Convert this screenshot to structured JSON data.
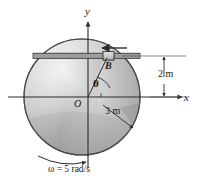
{
  "figure": {
    "axes": {
      "y_label": "y",
      "x_label": "x",
      "origin_label": "O"
    },
    "points": {
      "B_label": "B",
      "angle_label": "θ"
    },
    "dimensions": {
      "vertical_offset": "2 m",
      "radius": "3 m"
    },
    "annotations": {
      "angular_velocity": "ω = 5 rad/s"
    },
    "colors": {
      "disk_light": "#e8e8e8",
      "disk_mid": "#b4b4b4",
      "disk_dark": "#8f8f8f",
      "outline": "#3c3c3c",
      "text": "#1a1a1a",
      "background": "#ffffff"
    },
    "geometry": {
      "center_x": 82,
      "center_y": 97,
      "radius_px": 58,
      "slot_y": 56,
      "arrow_direction": "left"
    }
  }
}
